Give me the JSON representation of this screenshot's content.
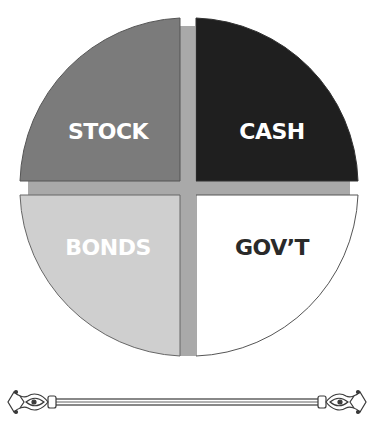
{
  "diagram": {
    "type": "quadrant-circle",
    "quadrants": [
      {
        "id": "stock",
        "position": "top-left",
        "label": "STOCK",
        "fill": "#7b7b7b",
        "text_color": "#ffffff"
      },
      {
        "id": "cash",
        "position": "top-right",
        "label": "CASH",
        "fill": "#1f1f1f",
        "text_color": "#ffffff"
      },
      {
        "id": "bonds",
        "position": "bottom-left",
        "label": "BONDS",
        "fill": "#cfcfcf",
        "text_color": "#ffffff"
      },
      {
        "id": "govt",
        "position": "bottom-right",
        "label": "GOV’T",
        "fill": "#ffffff",
        "text_color": "#2a2a2a"
      }
    ],
    "divider_color": "#a9a9a9",
    "outline_color": "#555555"
  },
  "decoration": {
    "type": "curtain-rod",
    "color": "#3a3a3a"
  }
}
